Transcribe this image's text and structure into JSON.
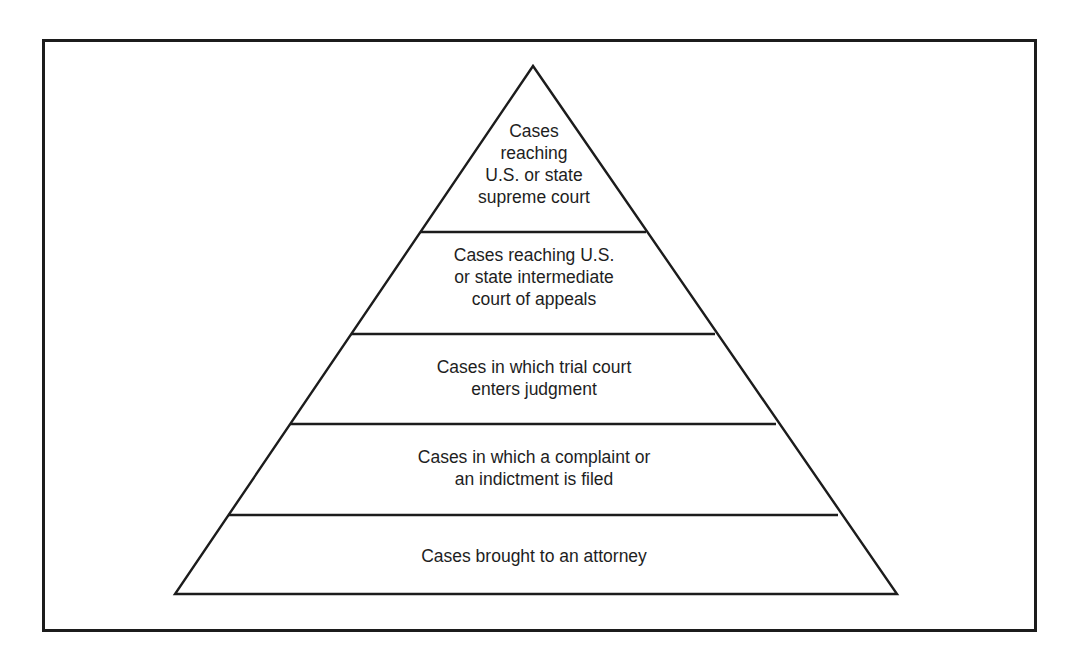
{
  "diagram": {
    "type": "pyramid",
    "line_color": "#1c1c1c",
    "tiers": [
      {
        "level": 1,
        "lines": [
          "Cases",
          "reaching",
          "U.S. or state",
          "supreme court"
        ]
      },
      {
        "level": 2,
        "lines": [
          "Cases reaching U.S.",
          "or state intermediate",
          "court of appeals"
        ]
      },
      {
        "level": 3,
        "lines": [
          "Cases in which trial court",
          "enters judgment"
        ]
      },
      {
        "level": 4,
        "lines": [
          "Cases in which a complaint or",
          "an indictment is filed"
        ]
      },
      {
        "level": 5,
        "lines": [
          "Cases brought to an attorney"
        ]
      }
    ]
  }
}
